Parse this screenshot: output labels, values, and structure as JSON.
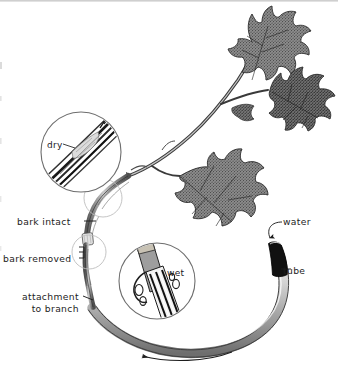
{
  "figure": {
    "background_color": "#ffffff",
    "ink_color": "#1d1d1d",
    "width": 338,
    "height": 373
  },
  "labels": {
    "bark_intact": "bark intact",
    "bark_removed": "bark removed",
    "attachment_line1": "attachment",
    "attachment_line2": "to branch",
    "water": "water",
    "tube": "tube"
  },
  "insets": {
    "dry": {
      "label": "dry",
      "description": "magnified view of stem with bark intact, fibers dry"
    },
    "wet": {
      "label": "wet",
      "description": "magnified view of stem with bark removed, wood wet with droplets"
    }
  },
  "elements": {
    "branch": "leafy-branch",
    "leaves_count": 4,
    "tube_open_end_fill": "#111111",
    "tube_body_fill": "#d7d7d7",
    "flow_arrow_direction": "leftward"
  }
}
